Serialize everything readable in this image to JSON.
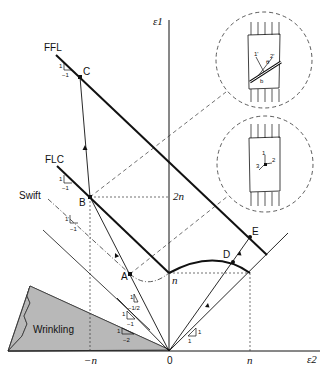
{
  "axes": {
    "x_label": "ε2",
    "y_label": "ε1",
    "x_ticks": [
      "−n",
      "0",
      "n"
    ],
    "y_ticks": [
      "n",
      "2n"
    ]
  },
  "curves": {
    "ffl": "FFL",
    "flc": "FLC",
    "swift": "Swift"
  },
  "points": [
    "A",
    "B",
    "C",
    "D",
    "E"
  ],
  "regions": {
    "wrinkling": "Wrinkling"
  },
  "slopes": {
    "ffl": {
      "rise": "1",
      "run": "−1"
    },
    "flc": {
      "rise": "1",
      "run": "−1"
    },
    "swift": {
      "rise": "1",
      "run": "−1"
    },
    "path_half": {
      "rise": "1",
      "run": "−1/2"
    },
    "path_one": {
      "rise": "1",
      "run": "−1"
    },
    "path_two": {
      "rise": "1",
      "run": "−2"
    },
    "biaxial": {
      "rise": "1",
      "run": "1"
    }
  },
  "insets": {
    "upper": {
      "labels": [
        "1'",
        "2'",
        "θ",
        "b"
      ]
    },
    "lower": {
      "labels": [
        "1",
        "2",
        "3"
      ]
    }
  },
  "colors": {
    "line": "#111111",
    "wrinkling_fill": "#b8b8b8"
  }
}
